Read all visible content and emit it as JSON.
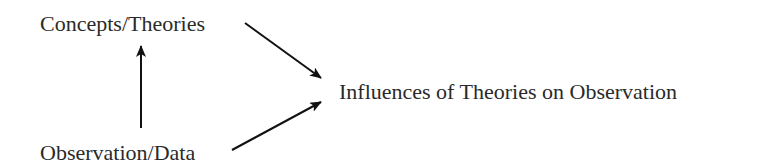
{
  "diagram": {
    "nodes": [
      {
        "id": "concepts",
        "label": "Concepts/Theories"
      },
      {
        "id": "observation",
        "label": "Observation/Data"
      },
      {
        "id": "influences",
        "label": "Influences of Theories on Observation"
      }
    ],
    "edges": [
      {
        "from": "observation",
        "to": "concepts"
      },
      {
        "from": "concepts",
        "to": "influences"
      },
      {
        "from": "observation",
        "to": "influences"
      }
    ],
    "colors": {
      "text": "#2a2a2a",
      "arrow": "#111111",
      "background": "#ffffff"
    }
  }
}
